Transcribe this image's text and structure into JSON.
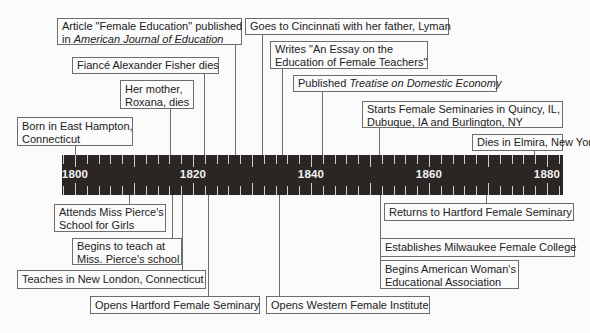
{
  "timeline": {
    "start_year": 1800,
    "end_year": 1880,
    "year_labels": [
      "1800",
      "1820",
      "1840",
      "1860",
      "1880"
    ],
    "tick_interval_years": 2,
    "bar_color": "#2b2523"
  },
  "events_above": [
    {
      "id": "born",
      "line1": "Born in East Hampton,",
      "line2": "Connecticut"
    },
    {
      "id": "mother",
      "line1": "Her mother,",
      "line2": "Roxana, dies"
    },
    {
      "id": "fiance",
      "line1": "Fiancé Alexander Fisher dies"
    },
    {
      "id": "article",
      "line1": "Article \"Female Education\" published",
      "line2_prefix": "in ",
      "line2_italic": "American Journal of Education"
    },
    {
      "id": "cincinnati",
      "line1": "Goes to Cincinnati with her father, Lyman"
    },
    {
      "id": "essay",
      "line1": "Writes \"An Essay on the",
      "line2": "Education of Female Teachers\""
    },
    {
      "id": "treatise",
      "line1_prefix": "Published ",
      "line1_italic": "Treatise on Domestic Economy"
    },
    {
      "id": "seminaries",
      "line1": "Starts Female Seminaries in Quincy, IL,",
      "line2": "Dubuque, IA and Burlington, NY"
    },
    {
      "id": "dies",
      "line1": "Dies in Elmira, New York"
    }
  ],
  "events_below": [
    {
      "id": "attends",
      "line1": "Attends Miss Pierce's",
      "line2": "School for Girls"
    },
    {
      "id": "begins-teach",
      "line1": "Begins to teach at",
      "line2": "Miss. Pierce's school"
    },
    {
      "id": "new-london",
      "line1": "Teaches in New London, Connecticut"
    },
    {
      "id": "hartford",
      "line1": "Opens Hartford Female Seminary"
    },
    {
      "id": "western",
      "line1": "Opens Western Female Institute"
    },
    {
      "id": "returns",
      "line1": "Returns to Hartford Female Seminary"
    },
    {
      "id": "milwaukee",
      "line1": "Establishes Milwaukee Female College"
    },
    {
      "id": "awea",
      "line1": "Begins American Woman's",
      "line2": "Educational Association"
    }
  ]
}
